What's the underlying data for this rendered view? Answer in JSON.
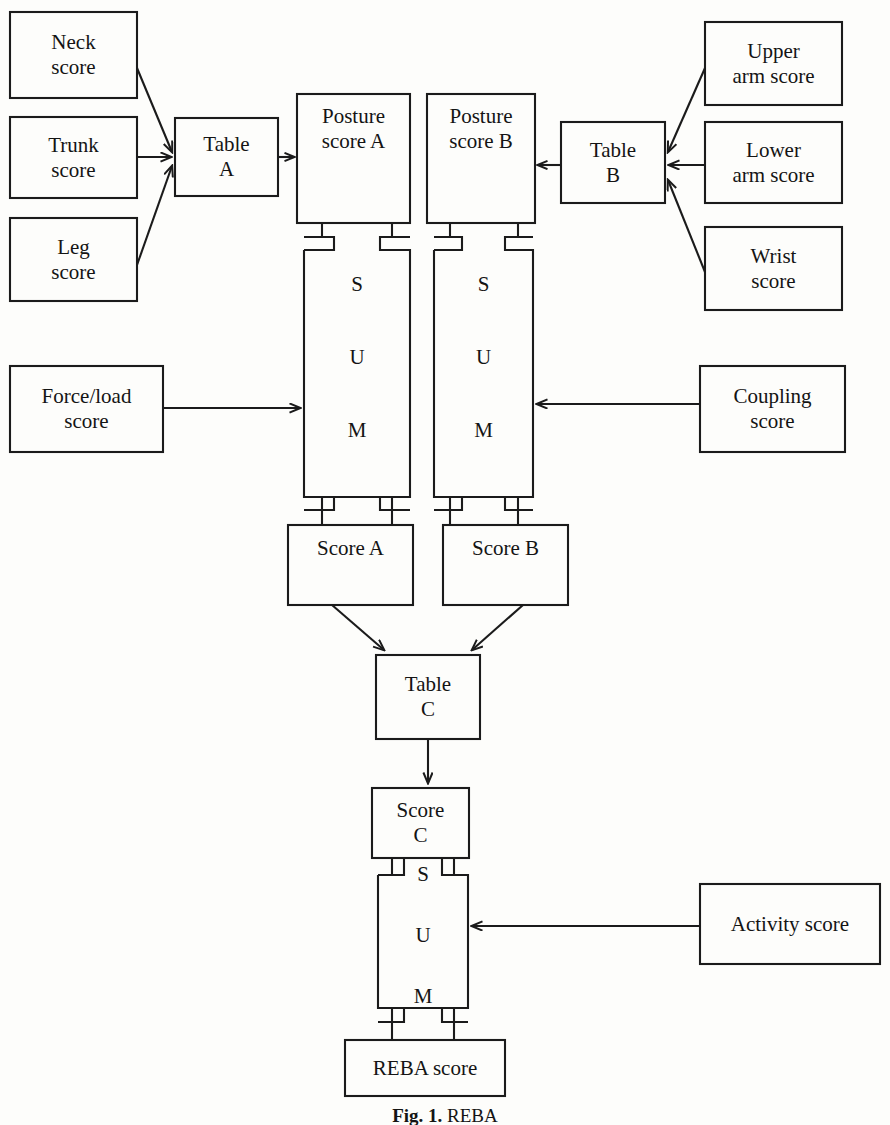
{
  "diagram": {
    "stroke_color": "#1b1b1b",
    "background_color": "#fdfdfb",
    "nodes": {
      "neck_score": "Neck\nscore",
      "trunk_score": "Trunk\nscore",
      "leg_score": "Leg\nscore",
      "table_a": "Table\nA",
      "posture_score_a": "Posture\nscore A",
      "posture_score_b": "Posture\nscore B",
      "table_b": "Table\nB",
      "upper_arm_score": "Upper\narm score",
      "lower_arm_score": "Lower\narm score",
      "wrist_score": "Wrist\nscore",
      "force_load_score": "Force/load\nscore",
      "coupling_score": "Coupling\nscore",
      "score_a": "Score A",
      "score_b": "Score B",
      "table_c": "Table\nC",
      "score_c": "Score\nC",
      "activity_score": "Activity score",
      "reba_score": "REBA score"
    },
    "sum_letters": [
      "S",
      "U",
      "M"
    ],
    "sum_blocks": [
      {
        "name": "sum-a",
        "letters": [
          "S",
          "U",
          "M"
        ]
      },
      {
        "name": "sum-b",
        "letters": [
          "S",
          "U",
          "M"
        ]
      },
      {
        "name": "sum-c",
        "letters": [
          "S",
          "U",
          "M"
        ]
      }
    ],
    "caption": {
      "figure_number": "Fig. 1.",
      "figure_text": "REBA"
    }
  }
}
